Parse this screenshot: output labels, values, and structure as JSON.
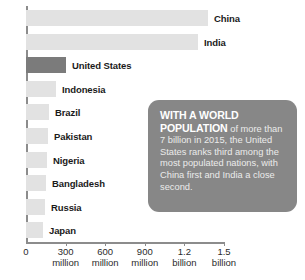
{
  "chart_data": {
    "type": "bar",
    "orientation": "horizontal",
    "title": "",
    "xlabel": "",
    "ylabel": "",
    "xlim": [
      0,
      1500000000
    ],
    "grid": false,
    "legend": null,
    "categories": [
      "China",
      "India",
      "United States",
      "Indonesia",
      "Brazil",
      "Pakistan",
      "Nigeria",
      "Bangladesh",
      "Russia",
      "Japan"
    ],
    "values": [
      1380000000,
      1310000000,
      320000000,
      258000000,
      208000000,
      197000000,
      191000000,
      163000000,
      144000000,
      127000000
    ],
    "highlighted_category": "United States",
    "tick_values": [
      0,
      300000000,
      600000000,
      900000000,
      1200000000,
      1500000000
    ],
    "tick_labels": [
      {
        "num": "0",
        "unit": ""
      },
      {
        "num": "300",
        "unit": "million"
      },
      {
        "num": "600",
        "unit": "million"
      },
      {
        "num": "900",
        "unit": "million"
      },
      {
        "num": "1.2",
        "unit": "billion"
      },
      {
        "num": "1.5",
        "unit": "billion"
      }
    ],
    "bars": [
      {
        "label": "China",
        "value": 1380000000,
        "px": 182,
        "highlight": false
      },
      {
        "label": "India",
        "value": 1310000000,
        "px": 172,
        "highlight": false
      },
      {
        "label": "United States",
        "value": 320000000,
        "px": 40,
        "highlight": true
      },
      {
        "label": "Indonesia",
        "value": 258000000,
        "px": 30,
        "highlight": false
      },
      {
        "label": "Brazil",
        "value": 208000000,
        "px": 23,
        "highlight": false
      },
      {
        "label": "Pakistan",
        "value": 197000000,
        "px": 22,
        "highlight": false
      },
      {
        "label": "Nigeria",
        "value": 191000000,
        "px": 21,
        "highlight": false
      },
      {
        "label": "Bangladesh",
        "value": 163000000,
        "px": 20,
        "highlight": false
      },
      {
        "label": "Russia",
        "value": 144000000,
        "px": 19,
        "highlight": false
      },
      {
        "label": "Japan",
        "value": 127000000,
        "px": 17,
        "highlight": false
      }
    ]
  },
  "callout": {
    "lead": "WITH A WORLD POPULATION",
    "body": " of more than 7 billion in 2015, the United States ranks third among the most populated nations, with China first and India a close second."
  },
  "colors": {
    "bar": "#e2e2e2",
    "bar_highlight": "#7b7b7b",
    "axis": "#8c8c8c",
    "callout_bg": "#878787",
    "text": "#1a1a1a",
    "background": "#ffffff"
  }
}
